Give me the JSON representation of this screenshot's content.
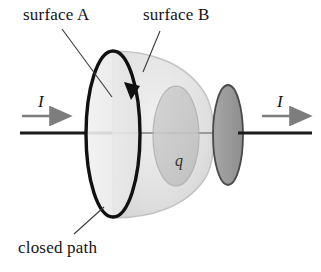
{
  "figure": {
    "width": 321,
    "height": 272,
    "background_color": "#ffffff"
  },
  "labels": {
    "surface_a": "surface A",
    "surface_b": "surface B",
    "closed_path": "closed path",
    "current_left": "I",
    "current_right": "I",
    "charge": "q"
  },
  "colors": {
    "ink": "#141414",
    "wire": "#1a1a1a",
    "wire_faded": "#9c9c9c",
    "arrow_gray": "#7d7d7d",
    "leader_line": "#3a3a3a",
    "surface_a_fill": "#e9e9e9",
    "surface_a_stroke": "#cfcfcf",
    "surface_b_fill": "#e2e2e2",
    "surface_b_stroke": "#c2c2c2",
    "inner_ellipse_fill": "#c9c9c9",
    "inner_ellipse_stroke": "#b0b0b0",
    "plate_fill": "#9a9a9a",
    "plate_stroke": "#4a4a4a",
    "closed_path_stroke": "#111111"
  },
  "geometry": {
    "wire_y": 133,
    "closed_path": {
      "cx": 113,
      "cy": 134,
      "rx": 27,
      "ry": 83,
      "stroke_width": 3.4
    },
    "surface_a_disc": {
      "cx": 113,
      "cy": 134,
      "rx": 27,
      "ry": 83
    },
    "surface_b_balloon": {
      "left_x": 113,
      "right_x": 216,
      "top_y": 55,
      "bottom_y": 214
    },
    "inner_ellipse": {
      "cx": 176,
      "cy": 136,
      "rx": 23,
      "ry": 50
    },
    "plate_disc": {
      "cx": 228,
      "cy": 135,
      "rx": 15,
      "ry": 50
    },
    "arrow_left": {
      "x1": 22,
      "x2": 72,
      "y": 116
    },
    "arrow_right": {
      "x1": 262,
      "x2": 312,
      "y": 116
    },
    "path_arrowhead": {
      "x": 132,
      "y": 92,
      "direction": "clockwise-down"
    }
  },
  "leaders": [
    {
      "name": "surface-a-leader",
      "x1": 62,
      "y1": 29,
      "x2": 112,
      "y2": 97
    },
    {
      "name": "surface-b-leader",
      "x1": 160,
      "y1": 31,
      "x2": 143,
      "y2": 72
    },
    {
      "name": "closed-path-leader",
      "x1": 74,
      "y1": 234,
      "x2": 104,
      "y2": 207
    }
  ]
}
